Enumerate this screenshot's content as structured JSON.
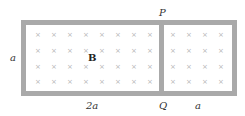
{
  "diagram": {
    "labels": {
      "P": "P",
      "Q": "Q",
      "height": "a",
      "left_width": "2a",
      "right_width": "a",
      "field": "B"
    },
    "field_symbol": "×",
    "colors": {
      "frame": "#a9a9a9",
      "field_marks": "#b5b5b5"
    },
    "left_grid": {
      "rows": 4,
      "cols": 8
    },
    "right_grid": {
      "rows": 4,
      "cols": 4
    }
  }
}
